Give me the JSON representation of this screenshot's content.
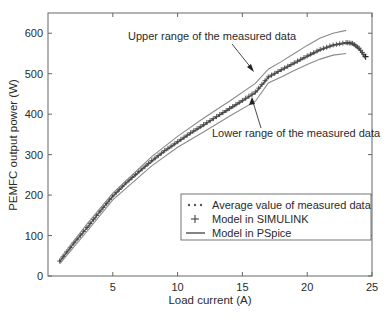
{
  "chart_data": {
    "type": "line",
    "title": "",
    "xlabel": "Load current (A)",
    "ylabel": "PEMFC output power (W)",
    "xlim": [
      0,
      25
    ],
    "ylim": [
      0,
      650
    ],
    "xticks": [
      5,
      10,
      15,
      20,
      25
    ],
    "yticks": [
      0,
      100,
      200,
      300,
      400,
      500,
      600
    ],
    "grid": false,
    "legend_position": "lower right",
    "series": [
      {
        "name": "Average value of measured data",
        "style": "dotted",
        "x": [
          0.9,
          2,
          3,
          4,
          5,
          6,
          7,
          8,
          9,
          10,
          11,
          12,
          13,
          14,
          15,
          16,
          17,
          18,
          19,
          20,
          21,
          22,
          23,
          23.5,
          24,
          24.5
        ],
        "y": [
          35,
          80,
          118,
          158,
          197,
          228,
          256,
          283,
          308,
          330,
          352,
          372,
          392,
          412,
          432,
          452,
          490,
          508,
          525,
          542,
          558,
          570,
          576,
          574,
          562,
          540
        ]
      },
      {
        "name": "Model in SIMULINK",
        "style": "plus-markers",
        "x": [
          0.9,
          2,
          3,
          4,
          5,
          6,
          7,
          8,
          9,
          10,
          11,
          12,
          13,
          14,
          15,
          16,
          17,
          18,
          19,
          20,
          21,
          22,
          23,
          23.5,
          24,
          24.5
        ],
        "y": [
          37,
          82,
          120,
          160,
          198,
          230,
          258,
          285,
          310,
          332,
          354,
          374,
          394,
          414,
          434,
          455,
          492,
          510,
          527,
          544,
          560,
          571,
          577,
          575,
          563,
          542
        ]
      },
      {
        "name": "Model in PSpice",
        "style": "solid",
        "x": [
          0.9,
          2,
          3,
          4,
          5,
          6,
          7,
          8,
          9,
          10,
          11,
          12,
          13,
          14,
          15,
          16,
          17,
          18,
          19,
          20,
          21,
          22,
          23,
          23.5,
          24,
          24.5
        ],
        "y": [
          36,
          81,
          119,
          159,
          197,
          229,
          257,
          284,
          309,
          331,
          353,
          373,
          393,
          413,
          433,
          453,
          491,
          509,
          526,
          543,
          559,
          570,
          576,
          574,
          561,
          538
        ]
      },
      {
        "name": "Upper range of the measured data",
        "style": "solid-thin",
        "legend": false,
        "x": [
          0.9,
          3,
          5,
          8,
          10,
          12,
          14,
          16,
          17,
          18,
          19,
          20,
          21,
          22,
          23
        ],
        "y": [
          42,
          128,
          205,
          295,
          345,
          390,
          432,
          476,
          511,
          530,
          550,
          570,
          588,
          600,
          607
        ]
      },
      {
        "name": "Lower range of the measured data",
        "style": "solid-thin",
        "legend": false,
        "x": [
          0.9,
          3,
          5,
          8,
          10,
          12,
          14,
          16,
          17,
          18,
          19,
          20,
          21,
          22,
          23
        ],
        "y": [
          30,
          110,
          188,
          272,
          318,
          356,
          395,
          432,
          477,
          492,
          508,
          523,
          536,
          546,
          550
        ]
      }
    ],
    "annotations": [
      {
        "text": "Upper range of the measured data",
        "arrow_to": [
          15.6,
          505
        ]
      },
      {
        "text": "Lower range of the measured data",
        "arrow_to": [
          15.7,
          434
        ]
      }
    ]
  },
  "legend": {
    "items": [
      {
        "label": "Average value of measured data",
        "symbol": "dotted-line"
      },
      {
        "label": "Model in SIMULINK",
        "symbol": "plus"
      },
      {
        "label": "Model in PSpice",
        "symbol": "solid-line"
      }
    ]
  },
  "annotations": {
    "upper": "Upper range of the measured data",
    "lower": "Lower range of the measured data"
  },
  "axes": {
    "xlabel": "Load current (A)",
    "ylabel": "PEMFC output power (W)",
    "xtick_labels": [
      "5",
      "10",
      "15",
      "20",
      "25"
    ],
    "ytick_labels": [
      "0",
      "100",
      "200",
      "300",
      "400",
      "500",
      "600"
    ]
  },
  "colors": {
    "axis": "#555555",
    "curve": "#4a4a4a",
    "range": "#8a8a8a",
    "text": "#2a2a2a"
  }
}
